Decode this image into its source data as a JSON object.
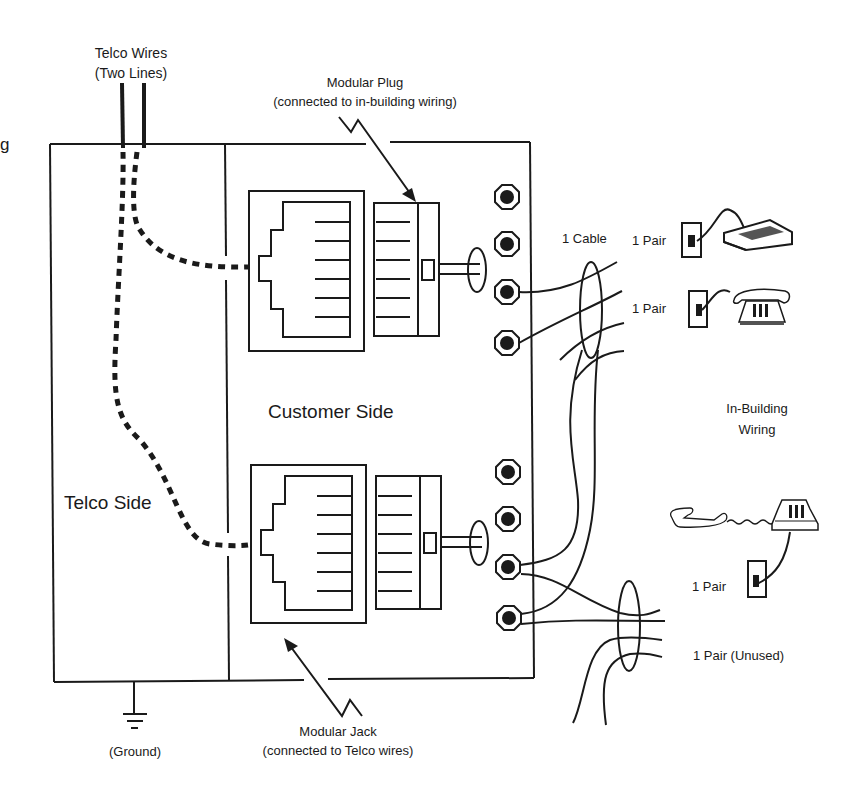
{
  "diagram": {
    "labels": {
      "telco_wires_line1": "Telco Wires",
      "telco_wires_line2": "(Two Lines)",
      "modular_plug_line1": "Modular Plug",
      "modular_plug_line2": "(connected to in-building wiring)",
      "customer_side": "Customer Side",
      "telco_side": "Telco Side",
      "one_cable": "1 Cable",
      "pair_modem": "1 Pair",
      "pair_phone": "1 Pair",
      "in_building_line1": "In-Building",
      "in_building_line2": "Wiring",
      "pair_phone2": "1 Pair",
      "pair_unused": "1 Pair (Unused)",
      "modular_jack_line1": "Modular Jack",
      "modular_jack_line2": "(connected to Telco wires)",
      "ground": "(Ground)",
      "clipped_left_fragment": "g"
    },
    "components": [
      {
        "name": "network-interface-box",
        "sections": [
          "Telco Side",
          "Customer Side"
        ]
      },
      {
        "name": "modular-jack",
        "count": 2
      },
      {
        "name": "modular-plug",
        "count": 2
      },
      {
        "name": "screw-terminal",
        "count": 8
      },
      {
        "name": "wall-jack",
        "count": 3
      },
      {
        "name": "modem-device",
        "count": 1
      },
      {
        "name": "telephone",
        "count": 2
      },
      {
        "name": "ground-symbol",
        "count": 1
      }
    ],
    "colors": {
      "ink": "#1a1a1a",
      "background": "#ffffff"
    }
  }
}
